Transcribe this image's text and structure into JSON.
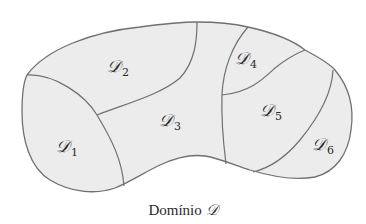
{
  "diagram": {
    "caption": {
      "text": "Domínio",
      "symbol": "𝒟"
    },
    "regions": [
      {
        "id": "D1",
        "symbol": "𝒟",
        "subscript": "1",
        "x": 67,
        "y": 148
      },
      {
        "id": "D2",
        "symbol": "𝒟",
        "subscript": "2",
        "x": 118,
        "y": 68
      },
      {
        "id": "D3",
        "symbol": "𝒟",
        "subscript": "3",
        "x": 170,
        "y": 122
      },
      {
        "id": "D4",
        "symbol": "𝒟",
        "subscript": "4",
        "x": 246,
        "y": 60
      },
      {
        "id": "D5",
        "symbol": "𝒟",
        "subscript": "5",
        "x": 271,
        "y": 112
      },
      {
        "id": "D6",
        "symbol": "𝒟",
        "subscript": "6",
        "x": 323,
        "y": 146
      }
    ],
    "colors": {
      "fill": "#ececec",
      "stroke": "#707070",
      "text": "#2a2a2a"
    }
  }
}
